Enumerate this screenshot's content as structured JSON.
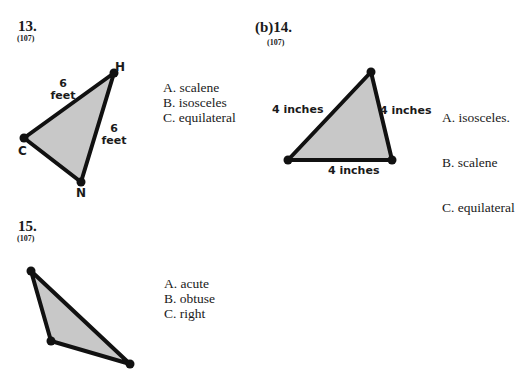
{
  "problems": [
    {
      "number": "13.",
      "prefix": "",
      "lesson": "(107)",
      "figure": {
        "shape": "triangle",
        "vertices": [
          "H",
          "C",
          "N"
        ],
        "side_labels": [
          "6",
          "feet",
          "6",
          "feet"
        ],
        "fill": "#c8c8c8",
        "stroke": "#111111"
      },
      "choices": [
        "A. scalene",
        "B. isosceles",
        "C. equilateral"
      ]
    },
    {
      "number": "14.",
      "prefix": "(b)",
      "lesson": "(107)",
      "figure": {
        "shape": "triangle",
        "side_labels": [
          "4 inches",
          "4 inches",
          "4 inches"
        ],
        "fill": "#c8c8c8",
        "stroke": "#111111"
      },
      "choices": [
        "A.  isosceles.",
        "B.  scalene",
        "C.  equilateral"
      ]
    },
    {
      "number": "15.",
      "prefix": "",
      "lesson": "(107)",
      "figure": {
        "shape": "triangle",
        "fill": "#c8c8c8",
        "stroke": "#111111"
      },
      "choices": [
        "A. acute",
        "B. obtuse",
        "C. right"
      ]
    }
  ]
}
